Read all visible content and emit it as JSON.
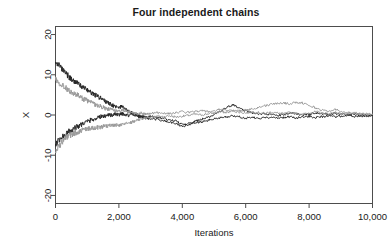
{
  "chart_data": {
    "type": "line",
    "title": "Four independent chains",
    "xlabel": "Iterations",
    "ylabel": "X",
    "xlim": [
      0,
      10000
    ],
    "ylim": [
      -22,
      22
    ],
    "grid": false,
    "legend": "none",
    "xticks": [
      0,
      2000,
      4000,
      6000,
      8000,
      10000
    ],
    "xticklabels": [
      "0",
      "2,000",
      "4,000",
      "6,000",
      "8,000",
      "10,000"
    ],
    "yticks": [
      -20,
      -10,
      0,
      10,
      20
    ],
    "yticklabels": [
      "-20",
      "-10",
      "0",
      "10",
      "20"
    ],
    "colors": {
      "dark": "#262626",
      "light": "#9a9a9a",
      "axis": "#4d4d4d",
      "background": "#ffffff"
    },
    "series": [
      {
        "name": "chain-1-dark-high",
        "color": "#262626",
        "start_value": 13.5,
        "x": [
          0,
          100,
          200,
          300,
          400,
          500,
          600,
          700,
          800,
          900,
          1000,
          1100,
          1200,
          1300,
          1400,
          1500,
          1600,
          1700,
          1800,
          1900,
          2000,
          2100,
          2200,
          2300,
          2400,
          2500,
          2600,
          2700,
          2800,
          2900,
          3000,
          3200,
          3400,
          3600,
          3800,
          4000,
          4200,
          4400,
          4600,
          4800,
          5000,
          5200,
          5400,
          5600,
          5800,
          6000,
          6200,
          6400,
          6600,
          6800,
          7000,
          7200,
          7400,
          7600,
          7800,
          8000,
          8200,
          8400,
          8600,
          8800,
          9000,
          9200,
          9400,
          9600,
          9800,
          10000
        ],
        "values": [
          13.5,
          12.4,
          11.3,
          10.6,
          9.7,
          8.9,
          8.4,
          7.8,
          7.2,
          6.8,
          6.3,
          5.7,
          5.2,
          4.8,
          4.3,
          3.8,
          3.3,
          2.9,
          2.4,
          2.0,
          1.7,
          2.3,
          1.4,
          1.0,
          0.6,
          0.3,
          0.1,
          -0.2,
          -0.4,
          -0.5,
          -0.3,
          -0.6,
          -0.9,
          -1.2,
          -1.5,
          -2.4,
          -2.1,
          -1.6,
          -1.1,
          -0.6,
          0.1,
          0.8,
          1.9,
          2.5,
          1.7,
          1.0,
          0.5,
          0.2,
          0.4,
          0.1,
          -0.2,
          0.1,
          0.5,
          0.3,
          0.0,
          0.2,
          0.5,
          0.3,
          0.1,
          0.4,
          0.2,
          0.0,
          0.3,
          0.1,
          -0.1,
          0.0
        ]
      },
      {
        "name": "chain-2-light-high",
        "color": "#9a9a9a",
        "start_value": 9.0,
        "x": [
          0,
          100,
          200,
          300,
          400,
          500,
          600,
          700,
          800,
          900,
          1000,
          1100,
          1200,
          1300,
          1400,
          1500,
          1600,
          1700,
          1800,
          1900,
          2000,
          2100,
          2200,
          2300,
          2400,
          2500,
          2600,
          2700,
          2800,
          2900,
          3000,
          3200,
          3400,
          3600,
          3800,
          4000,
          4200,
          4400,
          4600,
          4800,
          5000,
          5200,
          5400,
          5600,
          5800,
          6000,
          6200,
          6400,
          6600,
          6800,
          7000,
          7200,
          7400,
          7600,
          7800,
          8000,
          8200,
          8400,
          8600,
          8800,
          9000,
          9200,
          9400,
          9600,
          9800,
          10000
        ],
        "values": [
          9.0,
          8.2,
          7.5,
          6.9,
          6.3,
          5.7,
          5.2,
          4.9,
          4.3,
          3.9,
          3.6,
          3.2,
          2.8,
          2.5,
          2.2,
          1.9,
          1.6,
          1.4,
          1.2,
          1.0,
          0.9,
          1.2,
          1.0,
          0.8,
          0.6,
          0.4,
          0.3,
          0.5,
          0.3,
          0.2,
          0.4,
          0.6,
          0.5,
          0.3,
          0.6,
          0.8,
          0.6,
          0.9,
          1.1,
          0.8,
          1.0,
          1.4,
          1.1,
          1.3,
          1.0,
          1.2,
          1.5,
          1.9,
          2.3,
          2.6,
          2.9,
          3.0,
          2.8,
          3.1,
          3.0,
          2.4,
          1.8,
          1.2,
          0.9,
          1.4,
          1.0,
          0.6,
          0.4,
          0.2,
          0.3,
          0.1
        ]
      },
      {
        "name": "chain-3-dark-low",
        "color": "#262626",
        "start_value": -7.5,
        "x": [
          0,
          100,
          200,
          300,
          400,
          500,
          600,
          700,
          800,
          900,
          1000,
          1100,
          1200,
          1300,
          1400,
          1500,
          1600,
          1700,
          1800,
          1900,
          2000,
          2100,
          2200,
          2300,
          2400,
          2500,
          2600,
          2700,
          2800,
          2900,
          3000,
          3200,
          3400,
          3600,
          3800,
          4000,
          4200,
          4400,
          4600,
          4800,
          5000,
          5200,
          5400,
          5600,
          5800,
          6000,
          6200,
          6400,
          6600,
          6800,
          7000,
          7200,
          7400,
          7600,
          7800,
          8000,
          8200,
          8400,
          8600,
          8800,
          9000,
          9200,
          9400,
          9600,
          9800,
          10000
        ],
        "values": [
          -7.5,
          -6.4,
          -5.5,
          -4.8,
          -4.2,
          -3.7,
          -3.2,
          -2.8,
          -2.4,
          -2.0,
          -1.7,
          -1.3,
          -1.0,
          -0.8,
          -0.5,
          -0.3,
          -0.1,
          0.1,
          -0.1,
          0.2,
          0.0,
          0.3,
          0.1,
          -0.1,
          0.2,
          0.0,
          -0.3,
          -0.5,
          -0.7,
          -0.9,
          -1.2,
          -1.0,
          -1.4,
          -1.8,
          -2.2,
          -2.8,
          -2.5,
          -2.0,
          -1.7,
          -1.4,
          -1.0,
          -0.7,
          -0.4,
          -0.2,
          -0.5,
          -0.8,
          -0.6,
          -0.9,
          -0.7,
          -0.5,
          -0.8,
          -0.6,
          -0.4,
          -0.7,
          -0.5,
          -0.3,
          -0.6,
          -0.4,
          -0.2,
          -0.5,
          -0.3,
          -0.1,
          -0.4,
          -0.2,
          -0.3,
          -0.1
        ]
      },
      {
        "name": "chain-4-light-low",
        "color": "#9a9a9a",
        "start_value": -9.0,
        "x": [
          0,
          100,
          200,
          300,
          400,
          500,
          600,
          700,
          800,
          900,
          1000,
          1100,
          1200,
          1300,
          1400,
          1500,
          1600,
          1700,
          1800,
          1900,
          2000,
          2100,
          2200,
          2300,
          2400,
          2500,
          2600,
          2700,
          2800,
          2900,
          3000,
          3200,
          3400,
          3600,
          3800,
          4000,
          4200,
          4400,
          4600,
          4800,
          5000,
          5200,
          5400,
          5600,
          5800,
          6000,
          6200,
          6400,
          6600,
          6800,
          7000,
          7200,
          7400,
          7600,
          7800,
          8000,
          8200,
          8400,
          8600,
          8800,
          9000,
          9200,
          9400,
          9600,
          9800,
          10000
        ],
        "values": [
          -9.0,
          -7.8,
          -6.8,
          -6.0,
          -5.4,
          -4.9,
          -4.5,
          -4.2,
          -3.9,
          -3.7,
          -3.5,
          -3.3,
          -3.2,
          -3.1,
          -3.0,
          -2.9,
          -2.8,
          -2.7,
          -2.6,
          -2.5,
          -2.6,
          -2.4,
          -2.2,
          -2.0,
          -1.8,
          -1.5,
          -1.2,
          -1.0,
          -0.8,
          -0.6,
          -0.5,
          -0.3,
          -0.4,
          -0.2,
          -0.5,
          -0.3,
          -0.1,
          0.2,
          0.0,
          0.3,
          0.5,
          0.8,
          0.6,
          1.0,
          0.7,
          0.5,
          0.8,
          0.6,
          0.4,
          0.7,
          0.5,
          0.3,
          0.6,
          0.4,
          0.2,
          0.5,
          0.8,
          0.5,
          0.3,
          0.6,
          0.4,
          0.2,
          0.5,
          0.3,
          0.1,
          0.2
        ]
      }
    ]
  }
}
